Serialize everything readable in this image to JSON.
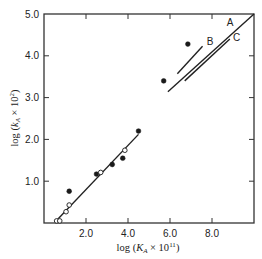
{
  "chart_data": {
    "type": "scatter",
    "title": "",
    "xlabel": "log (K_A × 10^11)",
    "ylabel": "log (k_A × 10^2)",
    "xlim": [
      0,
      10
    ],
    "ylim": [
      0,
      5
    ],
    "grid": false,
    "x_ticks": [
      2.0,
      4.0,
      6.0,
      8.0
    ],
    "x_tick_labels": [
      "2.0",
      "4.0",
      "6.0",
      "8.0"
    ],
    "y_ticks": [
      1.0,
      2.0,
      3.0,
      4.0,
      5.0
    ],
    "y_tick_labels": [
      "1.0",
      "2.0",
      "3.0",
      "4.0",
      "5.0"
    ],
    "series": [
      {
        "name": "filled",
        "marker": "filled-circle",
        "points": [
          [
            1.2,
            0.76
          ],
          [
            2.5,
            1.17
          ],
          [
            3.25,
            1.4
          ],
          [
            3.75,
            1.55
          ],
          [
            4.5,
            2.2
          ],
          [
            5.7,
            3.4
          ],
          [
            6.85,
            4.28
          ]
        ]
      },
      {
        "name": "open",
        "marker": "open-circle",
        "points": [
          [
            0.6,
            0.05
          ],
          [
            0.75,
            0.05
          ],
          [
            1.05,
            0.27
          ],
          [
            1.2,
            0.43
          ],
          [
            2.7,
            1.21
          ],
          [
            3.85,
            1.74
          ]
        ]
      }
    ],
    "lines": [
      {
        "name": "fit",
        "label": "",
        "x": [
          0.62,
          4.5
        ],
        "y": [
          0.07,
          2.12
        ]
      },
      {
        "name": "A",
        "label": "A",
        "x": [
          5.9,
          10.0
        ],
        "y": [
          3.14,
          5.0
        ]
      },
      {
        "name": "B",
        "label": "B",
        "x": [
          6.35,
          7.55
        ],
        "y": [
          3.57,
          4.23
        ]
      },
      {
        "name": "C",
        "label": "C",
        "x": [
          6.7,
          8.85
        ],
        "y": [
          3.4,
          4.4
        ]
      }
    ],
    "line_label_positions": {
      "A": [
        8.7,
        4.72
      ],
      "B": [
        7.75,
        4.26
      ],
      "C": [
        9.0,
        4.35
      ]
    }
  }
}
